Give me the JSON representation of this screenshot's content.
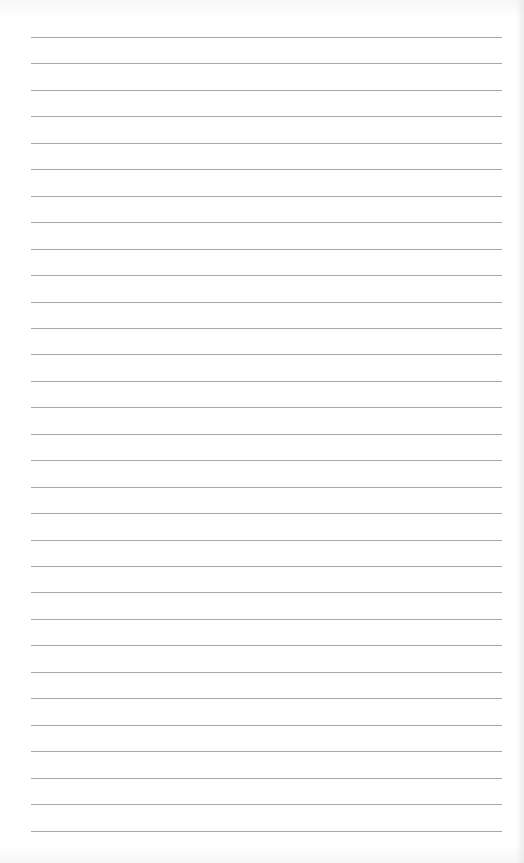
{
  "page": {
    "type": "lined-paper",
    "background_color": "#ffffff",
    "line_color": "#a8a8a8",
    "line_count": 31,
    "first_line_y": 37,
    "line_spacing": 26.45,
    "line_left": 31,
    "line_right": 502,
    "text": ""
  }
}
